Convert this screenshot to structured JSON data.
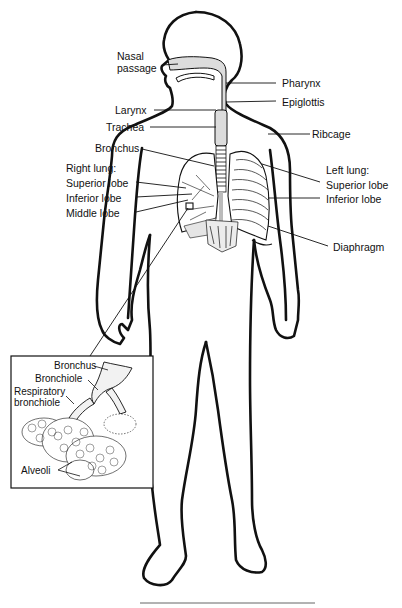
{
  "diagram": {
    "type": "anatomical-illustration",
    "labels": {
      "nasal_passage_1": "Nasal",
      "nasal_passage_2": "passage",
      "pharynx": "Pharynx",
      "epiglottis": "Epiglottis",
      "larynx": "Larynx",
      "trachea": "Trachea",
      "ribcage": "Ribcage",
      "bronchus": "Bronchus",
      "right_lung": "Right lung:",
      "right_superior": "Superior lobe",
      "right_inferior": "Inferior lobe",
      "right_middle": "Middle lobe",
      "left_lung": "Left lung:",
      "left_superior": "Superior lobe",
      "left_inferior": "Inferior lobe",
      "diaphragm": "Diaphragm"
    },
    "inset": {
      "labels": {
        "bronchus": "Bronchus",
        "bronchiole": "Bronchiole",
        "respiratory_bronchiole_1": "Respiratory",
        "respiratory_bronchiole_2": "bronchiole",
        "alveoli": "Alveoli"
      }
    },
    "colors": {
      "line": "#111111",
      "shade": "#d9d9d9",
      "background": "#ffffff"
    }
  }
}
